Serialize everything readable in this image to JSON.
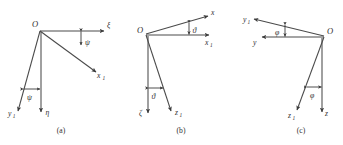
{
  "figure": {
    "kind": "euler-angle-rotation-diagrams",
    "background_color": "#ffffff",
    "line_color": "#4a4a4a",
    "text_color": "#2e2e2e",
    "panels": [
      {
        "id": "a",
        "caption": "(a)",
        "angle_symbol": "ψ",
        "angle_name": "psi",
        "origin_label": "O",
        "axis_labels": {
          "horizontal_top": "ξ",
          "tilted_right": "x",
          "tilted_right_sub": "1",
          "vertical_down": "η",
          "tilted_down": "y",
          "tilted_down_sub": "1"
        }
      },
      {
        "id": "b",
        "caption": "(b)",
        "angle_symbol": "ϑ",
        "angle_name": "theta",
        "origin_label": "O",
        "axis_labels": {
          "tilted_up_right": "x",
          "horizontal_right": "x",
          "horizontal_right_sub": "1",
          "vertical_down": "ζ",
          "tilted_down": "z",
          "tilted_down_sub": "1"
        }
      },
      {
        "id": "c",
        "caption": "(c)",
        "angle_symbol": "φ",
        "angle_name": "phi",
        "origin_label": "O",
        "axis_labels": {
          "tilted_up_left": "y",
          "tilted_up_left_sub": "1",
          "horizontal_left": "y",
          "vertical_down": "z",
          "tilted_down": "z",
          "tilted_down_sub": "1"
        }
      }
    ]
  }
}
